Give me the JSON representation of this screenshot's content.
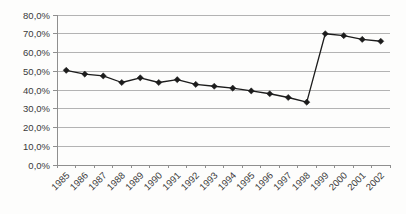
{
  "chart_data": {
    "type": "line",
    "title": "",
    "xlabel": "",
    "ylabel": "",
    "legend": "none",
    "grid": "horizontal",
    "marker": "diamond",
    "x_label_rotation": -45,
    "categories": [
      "1985",
      "1986",
      "1987",
      "1988",
      "1989",
      "1990",
      "1991",
      "1992",
      "1993",
      "1994",
      "1995",
      "1996",
      "1997",
      "1998",
      "1999",
      "2000",
      "2001",
      "2002"
    ],
    "series": [
      {
        "name": "",
        "values": [
          50.5,
          48.5,
          47.5,
          44,
          46.5,
          44,
          45.5,
          43,
          42,
          41,
          39.5,
          38,
          36,
          33.5,
          70,
          69,
          67,
          66
        ]
      }
    ],
    "ylim": [
      0,
      80
    ],
    "y_tick_step": 10,
    "y_ticks": [
      {
        "value": 0,
        "label": "0,0%"
      },
      {
        "value": 10,
        "label": "10,0%"
      },
      {
        "value": 20,
        "label": "20,0%"
      },
      {
        "value": 30,
        "label": "30,0%"
      },
      {
        "value": 40,
        "label": "40,0%"
      },
      {
        "value": 50,
        "label": "50,0%"
      },
      {
        "value": 60,
        "label": "60,0%"
      },
      {
        "value": 70,
        "label": "70,0%"
      },
      {
        "value": 80,
        "label": "80,0%"
      }
    ],
    "colors": {
      "line": "#1c1c1c",
      "marker": "#1c1c1c",
      "grid": "#b3b3b3",
      "axis": "#8f8f8f",
      "text": "#3a3a3a",
      "background": "#fdfdfc"
    }
  }
}
